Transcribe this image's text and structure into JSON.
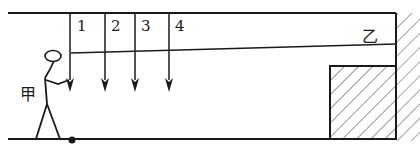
{
  "diagram": {
    "type": "physics-figure",
    "persons": {
      "jia": {
        "label": "甲"
      },
      "yi": {
        "label": "乙"
      }
    },
    "arrows": [
      {
        "label": "1",
        "x": 70
      },
      {
        "label": "2",
        "x": 105
      },
      {
        "label": "3",
        "x": 135
      },
      {
        "label": "4",
        "x": 169
      }
    ],
    "colors": {
      "stroke": "#1a1a1a",
      "background": "#ffffff"
    }
  }
}
